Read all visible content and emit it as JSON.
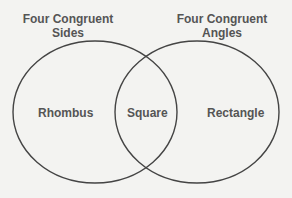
{
  "sets": [
    {
      "title_line1": "Four Congruent",
      "title_line2": "Sides",
      "region_label": "Rhombus"
    },
    {
      "title_line1": "Four Congruent",
      "title_line2": "Angles",
      "region_label": "Rectangle"
    }
  ],
  "intersection_label": "Square",
  "colors": {
    "background": "#f3f3f1",
    "stroke": "#444444",
    "text": "#555555"
  }
}
